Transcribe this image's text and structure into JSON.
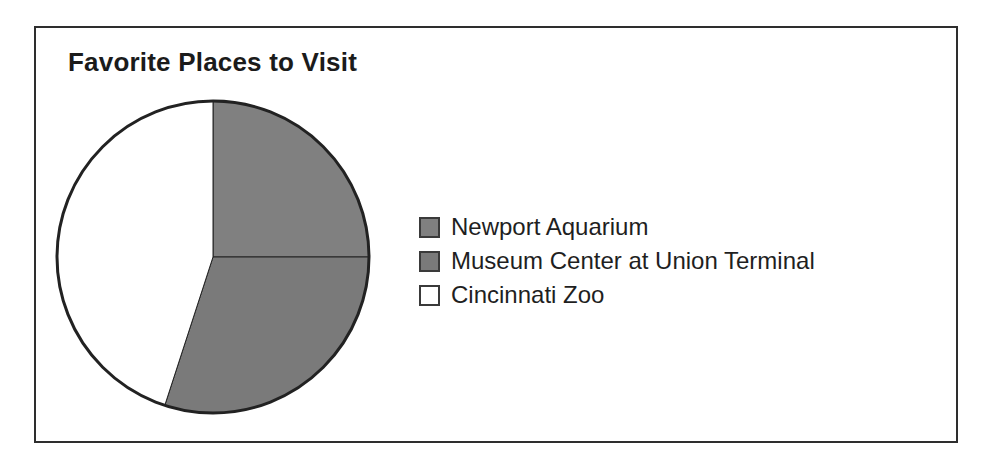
{
  "figure": {
    "title": "Favorite Places to Visit",
    "frame_color": "#2e2e2e",
    "background": "#ffffff"
  },
  "legend": {
    "items": [
      {
        "label": "Newport Aquarium",
        "swatch_color": "#808080",
        "swatch_name": "legend-swatch-newport-aquarium"
      },
      {
        "label": "Museum Center at Union Terminal",
        "swatch_color": "#7a7a7a",
        "swatch_name": "legend-swatch-museum-center"
      },
      {
        "label": "Cincinnati Zoo",
        "swatch_color": "#ffffff",
        "swatch_name": "legend-swatch-cincinnati-zoo"
      }
    ]
  },
  "chart_data": {
    "type": "pie",
    "title": "Favorite Places to Visit",
    "xlabel": "",
    "ylabel": "",
    "grid": false,
    "legend_position": "right",
    "start_angle_deg": 0,
    "direction": "clockwise",
    "categories": [
      "Newport Aquarium",
      "Museum Center at Union Terminal",
      "Cincinnati Zoo"
    ],
    "values": [
      25,
      30,
      45
    ],
    "value_unit": "percent",
    "colors": [
      "#808080",
      "#7a7a7a",
      "#ffffff"
    ],
    "slices": [
      {
        "label": "Newport Aquarium",
        "value": 25,
        "start_deg": 0,
        "end_deg": 90,
        "color": "#808080"
      },
      {
        "label": "Museum Center at Union Terminal",
        "value": 30,
        "start_deg": 90,
        "end_deg": 198,
        "color": "#7a7a7a"
      },
      {
        "label": "Cincinnati Zoo",
        "value": 45,
        "start_deg": 198,
        "end_deg": 360,
        "color": "#ffffff"
      }
    ],
    "slice_outline_color": "#222222",
    "annotations": []
  }
}
